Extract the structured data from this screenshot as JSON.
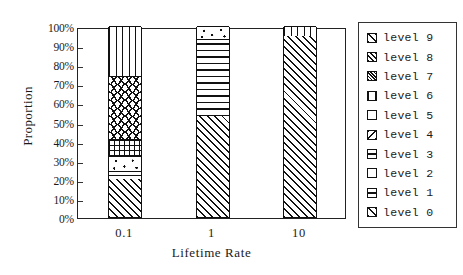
{
  "chart_data": {
    "type": "bar",
    "subtype": "stacked-100-percent",
    "title": "",
    "xlabel": "Lifetime Rate",
    "ylabel": "Proportion",
    "categories": [
      "0.1",
      "1",
      "10"
    ],
    "ylim": [
      0,
      100
    ],
    "yticks": [
      "0%",
      "10%",
      "20%",
      "30%",
      "40%",
      "50%",
      "60%",
      "70%",
      "80%",
      "90%",
      "100%"
    ],
    "ytick_values": [
      0,
      10,
      20,
      30,
      40,
      50,
      60,
      70,
      80,
      90,
      100
    ],
    "grid": false,
    "legend_position": "right",
    "legend_entries": [
      "level 9",
      "level 8",
      "level 7",
      "level 6",
      "level 5",
      "level 4",
      "level 3",
      "level 2",
      "level 1",
      "level 0"
    ],
    "series": [
      {
        "name": "level 0",
        "pattern": "diagonal-hatch",
        "values": [
          20,
          53,
          95
        ]
      },
      {
        "name": "level 1",
        "pattern": "horizontal-band",
        "values": [
          4,
          0,
          0
        ]
      },
      {
        "name": "level 2",
        "pattern": "white-sparse-dots",
        "values": [
          8,
          7,
          0
        ]
      },
      {
        "name": "level 3",
        "pattern": "grid-crosshatch",
        "values": [
          9,
          0,
          0
        ]
      },
      {
        "name": "level 4",
        "pattern": "zigzag-wave",
        "values": [
          33,
          0,
          0
        ]
      },
      {
        "name": "level 5",
        "pattern": "horizontal-lines",
        "values": [
          0,
          40,
          0
        ]
      },
      {
        "name": "level 6",
        "pattern": "vertical-lines",
        "values": [
          26,
          0,
          5
        ]
      },
      {
        "name": "level 7",
        "pattern": "dense-crosshatch",
        "values": [
          0,
          0,
          0
        ]
      },
      {
        "name": "level 8",
        "pattern": "cross-dot",
        "values": [
          0,
          0,
          0
        ]
      },
      {
        "name": "level 9",
        "pattern": "diagonal-hatch",
        "values": [
          0,
          0,
          0
        ]
      }
    ],
    "bars": [
      {
        "category": "0.1",
        "segments": [
          {
            "label": "level 0",
            "value": 20,
            "pattern": "diag"
          },
          {
            "label": "level 1",
            "value": 4,
            "pattern": "band"
          },
          {
            "label": "level 2",
            "value": 8,
            "pattern": "dots"
          },
          {
            "label": "level 3",
            "value": 9,
            "pattern": "grid"
          },
          {
            "label": "level 4",
            "value": 33,
            "pattern": "wave"
          },
          {
            "label": "level 6",
            "value": 26,
            "pattern": "vert"
          }
        ]
      },
      {
        "category": "1",
        "segments": [
          {
            "label": "level 0",
            "value": 53,
            "pattern": "diag"
          },
          {
            "label": "level 5",
            "value": 40,
            "pattern": "horz"
          },
          {
            "label": "level 2",
            "value": 7,
            "pattern": "dots"
          }
        ]
      },
      {
        "category": "10",
        "segments": [
          {
            "label": "level 0",
            "value": 95,
            "pattern": "diag"
          },
          {
            "label": "level 6",
            "value": 5,
            "pattern": "vert"
          }
        ]
      }
    ],
    "colors": {
      "ink": "#111111",
      "background": "#ffffff",
      "axis": "#222222"
    }
  }
}
